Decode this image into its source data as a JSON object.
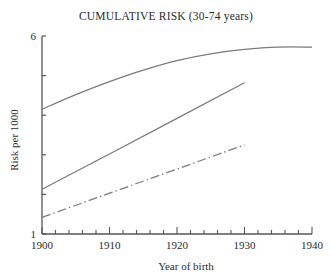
{
  "chart_data": {
    "type": "line",
    "title": "CUMULATIVE RISK (30-74 years)",
    "xlabel": "Year of birth",
    "ylabel": "Risk per 1000",
    "xlim": [
      1900,
      1940
    ],
    "ylim": [
      1,
      6
    ],
    "grid": false,
    "legend": "none",
    "xticks": [
      1900,
      1910,
      1920,
      1930,
      1940
    ],
    "xtick_labels": [
      "1900",
      "1910",
      "1920",
      "1930",
      "1940"
    ],
    "x_minor_tick_step": 2,
    "yticks": [
      1,
      2,
      3,
      4,
      5,
      6
    ],
    "ytick_labels": [
      "1",
      "",
      "",
      "",
      "",
      "6"
    ],
    "line_color": "#7a7a7a",
    "axis_color": "#555555",
    "series": [
      {
        "name": "upper-curve",
        "style": "solid",
        "x": [
          1900,
          1905,
          1910,
          1915,
          1920,
          1925,
          1930,
          1935,
          1940
        ],
        "y": [
          4.15,
          4.52,
          4.85,
          5.14,
          5.38,
          5.55,
          5.66,
          5.72,
          5.72
        ]
      },
      {
        "name": "middle-line",
        "style": "solid",
        "x": [
          1900,
          1910,
          1920,
          1930
        ],
        "y": [
          2.13,
          3.02,
          3.92,
          4.82
        ]
      },
      {
        "name": "lower-line",
        "style": "dash-dot",
        "x": [
          1900,
          1910,
          1920,
          1930
        ],
        "y": [
          1.42,
          2.03,
          2.64,
          3.25
        ]
      }
    ]
  }
}
